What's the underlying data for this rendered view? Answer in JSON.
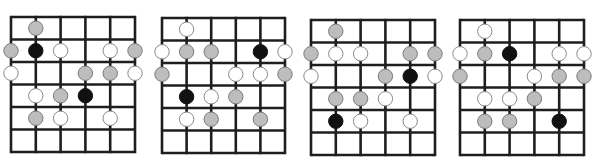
{
  "figure": {
    "type": "guitar-scale-fretboard-diagrams",
    "caption_visible": false,
    "legend": {
      "black": "root note",
      "gray": "scale tone (shaded)",
      "white": "scale tone (open)"
    },
    "grid": {
      "strings": 6,
      "frets": 6,
      "orientation": "vertical strings, horizontal frets"
    },
    "colors": {
      "line": "#1e1e1e",
      "black_fill": "#111111",
      "gray_fill": "#bdbdbd",
      "gray_stroke": "#7a7a7a",
      "white_fill": "#ffffff",
      "white_stroke": "#8a8a8a"
    },
    "diagrams": [
      {
        "id": "diagram-1",
        "left": 11,
        "top": 17,
        "width": 124,
        "height": 135,
        "dots": [
          {
            "fret": 1,
            "string": 2,
            "color": "gray"
          },
          {
            "fret": 2,
            "string": 1,
            "color": "gray"
          },
          {
            "fret": 2,
            "string": 2,
            "color": "black"
          },
          {
            "fret": 2,
            "string": 3,
            "color": "white"
          },
          {
            "fret": 2,
            "string": 5,
            "color": "white"
          },
          {
            "fret": 2,
            "string": 6,
            "color": "gray"
          },
          {
            "fret": 3,
            "string": 1,
            "color": "white"
          },
          {
            "fret": 3,
            "string": 4,
            "color": "gray"
          },
          {
            "fret": 3,
            "string": 5,
            "color": "gray"
          },
          {
            "fret": 3,
            "string": 6,
            "color": "white"
          },
          {
            "fret": 4,
            "string": 2,
            "color": "white"
          },
          {
            "fret": 4,
            "string": 3,
            "color": "gray"
          },
          {
            "fret": 4,
            "string": 4,
            "color": "black"
          },
          {
            "fret": 5,
            "string": 2,
            "color": "gray"
          },
          {
            "fret": 5,
            "string": 3,
            "color": "white"
          },
          {
            "fret": 5,
            "string": 5,
            "color": "white"
          }
        ]
      },
      {
        "id": "diagram-2",
        "left": 162,
        "top": 18,
        "width": 123,
        "height": 135,
        "dots": [
          {
            "fret": 1,
            "string": 2,
            "color": "white"
          },
          {
            "fret": 2,
            "string": 1,
            "color": "white"
          },
          {
            "fret": 2,
            "string": 2,
            "color": "gray"
          },
          {
            "fret": 2,
            "string": 3,
            "color": "gray"
          },
          {
            "fret": 2,
            "string": 5,
            "color": "black"
          },
          {
            "fret": 2,
            "string": 6,
            "color": "white"
          },
          {
            "fret": 3,
            "string": 1,
            "color": "gray"
          },
          {
            "fret": 3,
            "string": 4,
            "color": "white"
          },
          {
            "fret": 3,
            "string": 5,
            "color": "white"
          },
          {
            "fret": 3,
            "string": 6,
            "color": "gray"
          },
          {
            "fret": 4,
            "string": 2,
            "color": "black"
          },
          {
            "fret": 4,
            "string": 3,
            "color": "white"
          },
          {
            "fret": 4,
            "string": 4,
            "color": "gray"
          },
          {
            "fret": 5,
            "string": 2,
            "color": "white"
          },
          {
            "fret": 5,
            "string": 3,
            "color": "gray"
          },
          {
            "fret": 5,
            "string": 5,
            "color": "gray"
          }
        ]
      },
      {
        "id": "diagram-3",
        "left": 311,
        "top": 20,
        "width": 124,
        "height": 135,
        "dots": [
          {
            "fret": 1,
            "string": 2,
            "color": "gray"
          },
          {
            "fret": 2,
            "string": 1,
            "color": "gray"
          },
          {
            "fret": 2,
            "string": 2,
            "color": "white"
          },
          {
            "fret": 2,
            "string": 3,
            "color": "white"
          },
          {
            "fret": 2,
            "string": 5,
            "color": "gray"
          },
          {
            "fret": 2,
            "string": 6,
            "color": "gray"
          },
          {
            "fret": 3,
            "string": 1,
            "color": "white"
          },
          {
            "fret": 3,
            "string": 4,
            "color": "gray"
          },
          {
            "fret": 3,
            "string": 5,
            "color": "black"
          },
          {
            "fret": 3,
            "string": 6,
            "color": "white"
          },
          {
            "fret": 4,
            "string": 2,
            "color": "gray"
          },
          {
            "fret": 4,
            "string": 3,
            "color": "gray"
          },
          {
            "fret": 4,
            "string": 4,
            "color": "white"
          },
          {
            "fret": 5,
            "string": 2,
            "color": "black"
          },
          {
            "fret": 5,
            "string": 3,
            "color": "white"
          },
          {
            "fret": 5,
            "string": 5,
            "color": "white"
          }
        ]
      },
      {
        "id": "diagram-4",
        "left": 460,
        "top": 20,
        "width": 124,
        "height": 135,
        "dots": [
          {
            "fret": 1,
            "string": 2,
            "color": "white"
          },
          {
            "fret": 2,
            "string": 1,
            "color": "white"
          },
          {
            "fret": 2,
            "string": 2,
            "color": "gray"
          },
          {
            "fret": 2,
            "string": 3,
            "color": "black"
          },
          {
            "fret": 2,
            "string": 5,
            "color": "white"
          },
          {
            "fret": 2,
            "string": 6,
            "color": "white"
          },
          {
            "fret": 3,
            "string": 1,
            "color": "gray"
          },
          {
            "fret": 3,
            "string": 4,
            "color": "white"
          },
          {
            "fret": 3,
            "string": 5,
            "color": "gray"
          },
          {
            "fret": 3,
            "string": 6,
            "color": "gray"
          },
          {
            "fret": 4,
            "string": 2,
            "color": "white"
          },
          {
            "fret": 4,
            "string": 3,
            "color": "white"
          },
          {
            "fret": 4,
            "string": 4,
            "color": "gray"
          },
          {
            "fret": 5,
            "string": 2,
            "color": "gray"
          },
          {
            "fret": 5,
            "string": 3,
            "color": "gray"
          },
          {
            "fret": 5,
            "string": 5,
            "color": "black"
          }
        ]
      }
    ]
  }
}
